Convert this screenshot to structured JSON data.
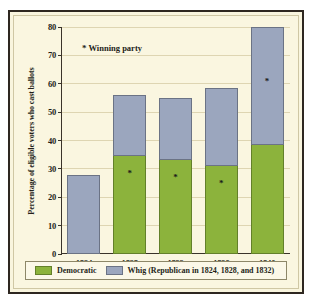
{
  "chart_data": {
    "type": "bar",
    "stacked": true,
    "title": "",
    "xlabel": "",
    "ylabel": "Percentage of eligible voters who cast ballots",
    "ylim": [
      0,
      80
    ],
    "yticks": [
      0,
      10,
      20,
      30,
      40,
      50,
      60,
      70,
      80
    ],
    "grid": true,
    "legend_position": "bottom",
    "categories": [
      "1824",
      "1828",
      "1832",
      "1836",
      "1840"
    ],
    "series": [
      {
        "name": "Democratic",
        "color": "#8cb33c",
        "values": [
          0,
          34.5,
          33,
          31,
          38.5
        ]
      },
      {
        "name": "Whig (Republican in 1824, 1828, and 1832)",
        "color": "#9ba6be",
        "values": [
          28,
          21.5,
          22,
          27.5,
          41.5
        ]
      }
    ],
    "totals": [
      28,
      56,
      55,
      58.5,
      80
    ],
    "annotations": {
      "winning_party_note": "Winning party",
      "winning_party_marker": "*",
      "winners": [
        {
          "year": "1824",
          "party": null
        },
        {
          "year": "1828",
          "party": "Democratic"
        },
        {
          "year": "1832",
          "party": "Democratic"
        },
        {
          "year": "1836",
          "party": "Democratic"
        },
        {
          "year": "1840",
          "party": "Whig"
        }
      ]
    }
  },
  "axis": {
    "y_title": "Percentage of eligible voters who cast ballots",
    "y_labels": [
      "80",
      "70",
      "60",
      "50",
      "40",
      "30",
      "20",
      "10",
      "0"
    ],
    "x_labels": [
      "1824",
      "1828",
      "1832",
      "1836",
      "1840"
    ]
  },
  "note": {
    "marker": "*",
    "text": "Winning party"
  },
  "legend": {
    "items": [
      {
        "label": "Democratic",
        "color": "#8cb33c"
      },
      {
        "label": "Whig (Republican in 1824, 1828, and 1832)",
        "color": "#9ba6be"
      }
    ]
  },
  "colors": {
    "democratic": "#8cb33c",
    "whig": "#9ba6be",
    "background": "#faf6e0",
    "frame": "#2e2720",
    "gridline": "#ded5b2"
  }
}
